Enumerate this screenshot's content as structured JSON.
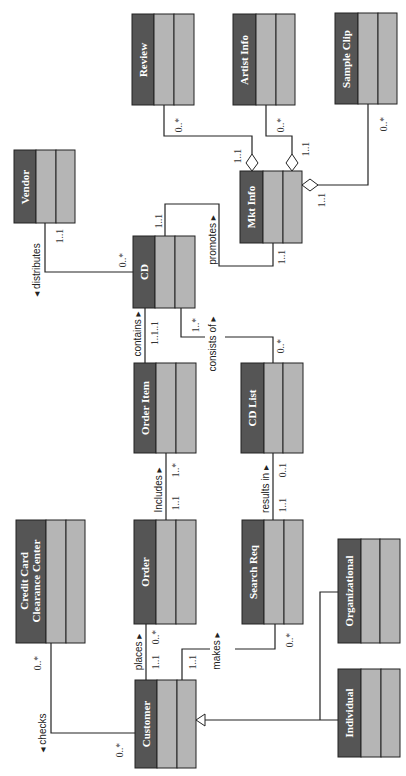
{
  "diagram": {
    "type": "UML class diagram (rotated 90°)",
    "classes": [
      {
        "id": "review",
        "name": "Review"
      },
      {
        "id": "artist_info",
        "name": "Artist Info"
      },
      {
        "id": "sample_clip",
        "name": "Sample Clip"
      },
      {
        "id": "vendor",
        "name": "Vendor"
      },
      {
        "id": "mkt_info",
        "name": "Mkt Info"
      },
      {
        "id": "cd",
        "name": "CD"
      },
      {
        "id": "order_item",
        "name": "Order Item"
      },
      {
        "id": "cd_list",
        "name": "CD List"
      },
      {
        "id": "credit_card",
        "name_line1": "Credit Card",
        "name_line2": "Clearance Center"
      },
      {
        "id": "order",
        "name": "Order"
      },
      {
        "id": "search_req",
        "name": "Search Req"
      },
      {
        "id": "organizational",
        "name": "Organizational"
      },
      {
        "id": "customer",
        "name": "Customer"
      },
      {
        "id": "individual",
        "name": "Individual"
      }
    ],
    "associations": {
      "review_mkt": {
        "mult_a": "0..*",
        "mult_b": "1..1"
      },
      "artist_mkt": {
        "mult_a": "0..*",
        "mult_b": "1..1"
      },
      "sample_mkt": {
        "mult_a": "0..*",
        "mult_b": "1..1"
      },
      "distributes": {
        "label": "◂ distributes",
        "mult_vendor": "1..1",
        "mult_cd": "0..*"
      },
      "promotes": {
        "label": "promotes ▸",
        "mult_cd": "1..1",
        "mult_mkt": "1..1"
      },
      "contains": {
        "label": "contains ▸",
        "mult": "1..1..1"
      },
      "consists_of": {
        "label": "consists of ▸",
        "mult_cd": "1..*",
        "mult_list": "0..*"
      },
      "includes": {
        "label": "Includes ▸",
        "mult_order": "1..1",
        "mult_item": "1..*"
      },
      "results_in": {
        "label": "results in ▸",
        "mult_req": "1..1",
        "mult_list": "0..1"
      },
      "places": {
        "label": "places ▸",
        "mult_customer": "1..1",
        "mult_order": "0..*"
      },
      "makes": {
        "label": "makes ▸",
        "mult_customer": "1..1",
        "mult_req": "0..*"
      },
      "checks": {
        "label": "◂ checks",
        "mult_cc": "0..*",
        "mult_customer": "0..*"
      }
    },
    "colors": {
      "name_compartment": "#555555",
      "other_compartments": "#b5b5b5",
      "lines": "#222222"
    }
  }
}
